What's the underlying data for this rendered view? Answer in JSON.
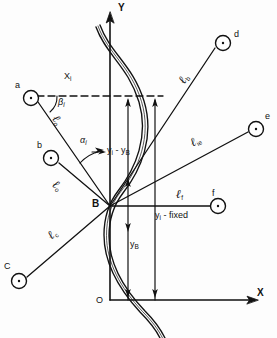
{
  "figure": {
    "axes": {
      "y_label": "Y",
      "x_label": "X",
      "origin_label": "O"
    },
    "vertex": {
      "label": "B",
      "name": "bend-point-b"
    },
    "nodes": [
      {
        "id": "a",
        "label": "a",
        "cx": 31,
        "cy": 98
      },
      {
        "id": "b",
        "label": "b",
        "cx": 51,
        "cy": 158
      },
      {
        "id": "c",
        "label": "C",
        "cx": 19,
        "cy": 281
      },
      {
        "id": "d",
        "label": "d",
        "cx": 223,
        "cy": 43
      },
      {
        "id": "e",
        "label": "e",
        "cx": 256,
        "cy": 129
      },
      {
        "id": "f",
        "label": "f",
        "cx": 218,
        "cy": 206
      }
    ],
    "segment_labels": [
      {
        "id": "l-a",
        "text": "ℓ",
        "subscript": "o",
        "x": 62,
        "y": 121
      },
      {
        "id": "l-b",
        "text": "ℓ",
        "subscript": "o",
        "x": 60,
        "y": 185
      },
      {
        "id": "l-c",
        "text": "ℓ",
        "subscript": "c",
        "x": 47,
        "y": 240
      },
      {
        "id": "l-d",
        "text": "ℓ",
        "subscript": "b",
        "x": 178,
        "y": 87
      },
      {
        "id": "l-e",
        "text": "ℓ",
        "subscript": "ie",
        "x": 190,
        "y": 145
      },
      {
        "id": "l-f",
        "text": "ℓ",
        "subscript": "f",
        "x": 178,
        "y": 194
      }
    ],
    "annotations": {
      "x_i": {
        "base": "X",
        "sub": "i",
        "x": 64,
        "y": 76
      },
      "beta_i": {
        "base": "β",
        "sub": "i",
        "x": 58,
        "y": 100
      },
      "alpha_i": {
        "base": "α",
        "sub": "i",
        "x": 81,
        "y": 138
      },
      "yi_minus_yb": {
        "text": "y",
        "sub1": "i",
        "mid": " - y",
        "sub2": "B",
        "x": 105,
        "y": 155
      },
      "y_b": {
        "base": "y",
        "sub": "B",
        "x": 130,
        "y": 245
      },
      "yi_fixed": {
        "text": "y",
        "sub": "i",
        "rest": " - fixed",
        "x": 155,
        "y": 216
      }
    },
    "colors": {
      "ink": "#111111",
      "paper": "#fdfdfd"
    }
  }
}
